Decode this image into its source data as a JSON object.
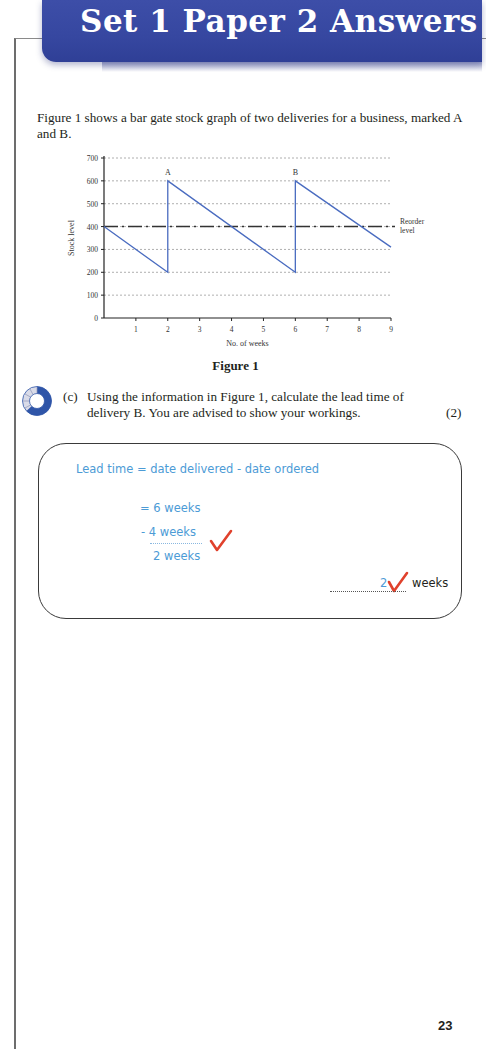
{
  "header": {
    "title": "Set 1 Paper 2 Answers",
    "banner_color": "#3647a0"
  },
  "intro": {
    "text": "Figure 1 shows a bar gate stock graph of two deliveries for a business, marked A and B."
  },
  "figure": {
    "caption": "Figure 1"
  },
  "chart_data": {
    "type": "line",
    "title": "",
    "xlabel": "No. of weeks",
    "ylabel": "Stock level",
    "xlim": [
      0,
      9
    ],
    "ylim": [
      0,
      700
    ],
    "x_ticks": [
      1,
      2,
      3,
      4,
      5,
      6,
      7,
      8,
      9
    ],
    "y_ticks": [
      0,
      100,
      200,
      300,
      400,
      500,
      600,
      700
    ],
    "grid": "horizontal dotted",
    "series": [
      {
        "name": "Stock level",
        "color": "#4a6cc0",
        "points": [
          [
            0,
            400
          ],
          [
            2,
            200
          ],
          [
            2,
            600
          ],
          [
            6,
            200
          ],
          [
            6,
            600
          ],
          [
            9,
            310
          ]
        ]
      }
    ],
    "reference_lines": [
      {
        "name": "Reorder level",
        "y": 400,
        "style": "dashed",
        "label": "Reorder\nlevel"
      }
    ],
    "annotations": [
      {
        "text": "A",
        "x": 2,
        "y": 600
      },
      {
        "text": "B",
        "x": 6,
        "y": 600
      }
    ]
  },
  "question": {
    "label": "(c)",
    "text": "Using the information in Figure 1, calculate the lead time of delivery B. You are advised to show your workings.",
    "marks": "(2)",
    "icon": "difficulty-gauge-icon"
  },
  "answer": {
    "line1": "Lead time = date delivered - date ordered",
    "line2": "= 6 weeks",
    "line3": "- 4 weeks",
    "line4": "2 weeks",
    "final_value": "2",
    "unit": "weeks",
    "handwriting_color": "#4c9bd6",
    "tick_color": "#e0412c"
  },
  "footer": {
    "page_number": "23"
  }
}
